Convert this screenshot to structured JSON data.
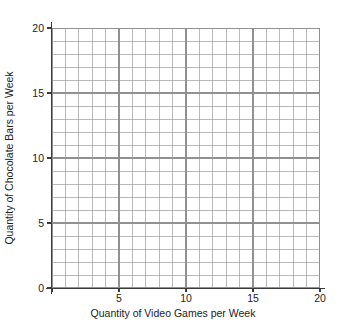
{
  "chart_data": {
    "type": "scatter",
    "title": "",
    "subtitle": "",
    "xlabel": "Quantity of Video Games per Week",
    "ylabel": "Quantity of Chocolate Bars per Week",
    "xlim": [
      0,
      20
    ],
    "ylim": [
      0,
      20
    ],
    "xticks": [
      0,
      5,
      10,
      15,
      20
    ],
    "yticks": [
      0,
      5,
      10,
      15,
      20
    ],
    "xtick_labels": [
      "",
      "5",
      "10",
      "15",
      "20"
    ],
    "ytick_labels": [
      "0",
      "5",
      "10",
      "15",
      "20"
    ],
    "origin_label": "0",
    "grid": true,
    "grid_minor_step": 1,
    "grid_color": "#8c8c8c",
    "axis_color": "#3a3a3a",
    "background_color": "#ffffff",
    "legend": null,
    "legend_position": "none",
    "series": [],
    "values": [],
    "x": [],
    "annotations": [],
    "note": "empty coordinate grid, no data points plotted"
  },
  "axes": {
    "x": {
      "label": "Quantity of Video Games per Week",
      "ticks": [
        {
          "value": 0,
          "label": ""
        },
        {
          "value": 5,
          "label": "5"
        },
        {
          "value": 10,
          "label": "10"
        },
        {
          "value": 15,
          "label": "15"
        },
        {
          "value": 20,
          "label": "20"
        }
      ]
    },
    "y": {
      "label": "Quantity of Chocolate Bars per Week",
      "ticks": [
        {
          "value": 0,
          "label": "0"
        },
        {
          "value": 5,
          "label": "5"
        },
        {
          "value": 10,
          "label": "10"
        },
        {
          "value": 15,
          "label": "15"
        },
        {
          "value": 20,
          "label": "20"
        }
      ]
    }
  }
}
